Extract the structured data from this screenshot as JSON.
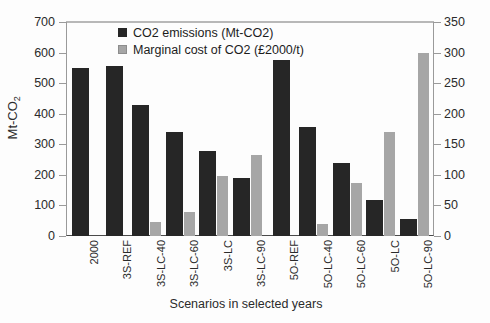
{
  "chart_data": {
    "type": "bar",
    "title": "",
    "xlabel": "Scenarios in selected years",
    "ylabel": "Mt-CO2",
    "ylabel_main": "Mt-CO",
    "ylabel_sub": "2",
    "categories": [
      "2000",
      "3S-REF",
      "3S-LC-40",
      "3S-LC-60",
      "3S-LC",
      "3S-LC-90",
      "5O-REF",
      "5O-LC-40",
      "5O-LC-60",
      "5O-LC",
      "5O-LC-90"
    ],
    "series": [
      {
        "name": "CO2 emissions (Mt-CO2)",
        "axis": "left",
        "color": "#262626",
        "values": [
          549,
          557,
          428,
          339,
          277,
          190,
          576,
          356,
          238,
          118,
          57
        ]
      },
      {
        "name": "Marginal cost of CO2 (£2000/t)",
        "axis": "right",
        "color": "#a6a6a6",
        "values": [
          0,
          0,
          23,
          39,
          98,
          133,
          0,
          20,
          87,
          170,
          300
        ]
      }
    ],
    "ylim": [
      0,
      700
    ],
    "ylim_right": [
      0,
      350
    ],
    "yticks": [
      0,
      100,
      200,
      300,
      400,
      500,
      600,
      700
    ],
    "yticks_right": [
      0,
      50,
      100,
      150,
      200,
      250,
      300,
      350
    ],
    "grid": false,
    "legend_position": "top-left-inside"
  },
  "legend": {
    "items": [
      {
        "label": "CO2 emissions (Mt-CO2)",
        "swatch": "dark-square-icon"
      },
      {
        "label": "Marginal cost of CO2 (£2000/t)",
        "swatch": "light-square-icon"
      }
    ]
  }
}
